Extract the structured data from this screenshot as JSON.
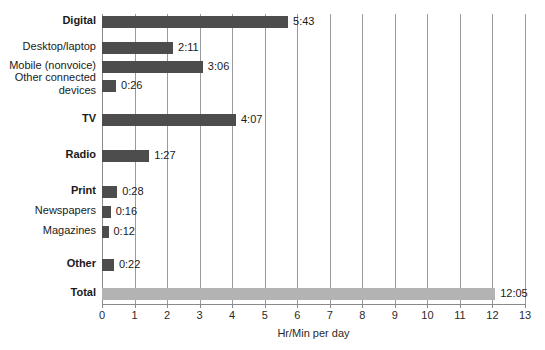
{
  "chart_data": {
    "type": "bar",
    "orientation": "horizontal",
    "title": "",
    "xlabel": "Hr/Min per day",
    "ylabel": "",
    "xlim": [
      0,
      13
    ],
    "xticks": [
      "0",
      "1",
      "2",
      "3",
      "4",
      "5",
      "6",
      "7",
      "8",
      "9",
      "10",
      "11",
      "12",
      "13"
    ],
    "grid": true,
    "legend": "none",
    "colors": {
      "bar": "#4d4d4d",
      "total_bar": "#b3b3b3",
      "gridline": "#9a9a9a",
      "text": "#1a1a1a",
      "background": "#ffffff"
    },
    "categories": [
      "Digital",
      "Desktop/laptop",
      "Mobile (nonvoice)",
      "Other connected devices",
      "TV",
      "Radio",
      "Print",
      "Newspapers",
      "Magazines",
      "Other",
      "Total"
    ],
    "values": [
      5.717,
      2.183,
      3.1,
      0.433,
      4.117,
      1.45,
      0.467,
      0.267,
      0.2,
      0.367,
      12.083
    ],
    "value_labels": [
      "5:43",
      "2:11",
      "3:06",
      "0:26",
      "4:07",
      "1:27",
      "0:28",
      "0:16",
      "0:12",
      "0:22",
      "12:05"
    ],
    "rows": [
      {
        "label": "Digital",
        "label_lines": [
          "Digital"
        ],
        "bold": true,
        "value": 5.717,
        "value_label": "5:43",
        "y": 16,
        "style": "bar"
      },
      {
        "label": "Desktop/laptop",
        "label_lines": [
          "Desktop/laptop"
        ],
        "bold": false,
        "value": 2.183,
        "value_label": "2:11",
        "y": 42,
        "style": "bar"
      },
      {
        "label": "Mobile (nonvoice)",
        "label_lines": [
          "Mobile (nonvoice)"
        ],
        "bold": false,
        "value": 3.1,
        "value_label": "3:06",
        "y": 61,
        "style": "bar"
      },
      {
        "label": "Other connected devices",
        "label_lines": [
          "Other connected",
          "devices"
        ],
        "bold": false,
        "value": 0.433,
        "value_label": "0:26",
        "y": 80,
        "style": "bar"
      },
      {
        "label": "TV",
        "label_lines": [
          "TV"
        ],
        "bold": true,
        "value": 4.117,
        "value_label": "4:07",
        "y": 114,
        "style": "bar"
      },
      {
        "label": "Radio",
        "label_lines": [
          "Radio"
        ],
        "bold": true,
        "value": 1.45,
        "value_label": "1:27",
        "y": 150,
        "style": "bar"
      },
      {
        "label": "Print",
        "label_lines": [
          "Print"
        ],
        "bold": true,
        "value": 0.467,
        "value_label": "0:28",
        "y": 186,
        "style": "bar"
      },
      {
        "label": "Newspapers",
        "label_lines": [
          "Newspapers"
        ],
        "bold": false,
        "value": 0.267,
        "value_label": "0:16",
        "y": 206,
        "style": "bar"
      },
      {
        "label": "Magazines",
        "label_lines": [
          "Magazines"
        ],
        "bold": false,
        "value": 0.2,
        "value_label": "0:12",
        "y": 226,
        "style": "bar"
      },
      {
        "label": "Other",
        "label_lines": [
          "Other"
        ],
        "bold": true,
        "value": 0.367,
        "value_label": "0:22",
        "y": 259,
        "style": "bar"
      },
      {
        "label": "Total",
        "label_lines": [
          "Total"
        ],
        "bold": true,
        "value": 12.083,
        "value_label": "12:05",
        "y": 288,
        "style": "total"
      }
    ]
  }
}
